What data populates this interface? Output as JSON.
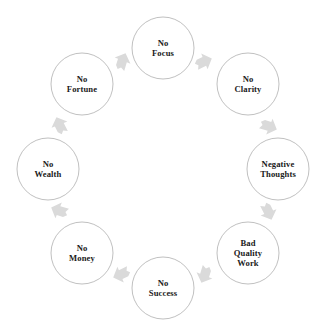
{
  "diagram": {
    "type": "cycle",
    "title": "",
    "background_color": "#ffffff",
    "circle_stroke_color": "#b9b9b9",
    "arrow_color": "#dadada",
    "text_color": "#1a1a1a",
    "direction": "clockwise",
    "node_count": 8,
    "nodes": [
      {
        "id": "no-focus",
        "label": "No Focus",
        "lines": [
          "No",
          "Focus"
        ],
        "cx": 163,
        "cy": 48,
        "r": 31
      },
      {
        "id": "no-clarity",
        "label": "No Clarity",
        "lines": [
          "No",
          "Clarity"
        ],
        "cx": 248,
        "cy": 84,
        "r": 31
      },
      {
        "id": "negative-thoughts",
        "label": "Negative Thoughts",
        "lines": [
          "Negative",
          "Thoughts"
        ],
        "cx": 278,
        "cy": 169,
        "r": 31
      },
      {
        "id": "bad-quality-work",
        "label": "Bad Quality Work",
        "lines": [
          "Bad",
          "Quality",
          "Work"
        ],
        "cx": 248,
        "cy": 253,
        "r": 31
      },
      {
        "id": "no-success",
        "label": "No Success",
        "lines": [
          "No",
          "Success"
        ],
        "cx": 163,
        "cy": 288,
        "r": 31
      },
      {
        "id": "no-money",
        "label": "No Money",
        "lines": [
          "No",
          "Money"
        ],
        "cx": 82,
        "cy": 253,
        "r": 31
      },
      {
        "id": "no-wealth",
        "label": "No Wealth",
        "lines": [
          "No",
          "Wealth"
        ],
        "cx": 48,
        "cy": 169,
        "r": 31
      },
      {
        "id": "no-fortune",
        "label": "No Fortune",
        "lines": [
          "No",
          "Fortune"
        ],
        "cx": 82,
        "cy": 84,
        "r": 31
      }
    ],
    "arrows": [
      {
        "id": "arrow-no-focus-to-no-clarity",
        "from": "no-focus",
        "to": "no-clarity",
        "cx": 203,
        "cy": 62,
        "angle": 68
      },
      {
        "id": "arrow-no-clarity-to-negative-thoughts",
        "from": "no-clarity",
        "to": "negative-thoughts",
        "cx": 268,
        "cy": 126,
        "angle": 112
      },
      {
        "id": "arrow-negative-thoughts-to-bad-quality-work",
        "from": "negative-thoughts",
        "to": "bad-quality-work",
        "cx": 268,
        "cy": 211,
        "angle": 158
      },
      {
        "id": "arrow-bad-quality-work-to-no-success",
        "from": "bad-quality-work",
        "to": "no-success",
        "cx": 205,
        "cy": 274,
        "angle": 202
      },
      {
        "id": "arrow-no-success-to-no-money",
        "from": "no-success",
        "to": "no-money",
        "cx": 122,
        "cy": 274,
        "angle": 248
      },
      {
        "id": "arrow-no-money-to-no-wealth",
        "from": "no-money",
        "to": "no-wealth",
        "cx": 60,
        "cy": 211,
        "angle": 292
      },
      {
        "id": "arrow-no-wealth-to-no-fortune",
        "from": "no-wealth",
        "to": "no-fortune",
        "cx": 60,
        "cy": 126,
        "angle": 338
      },
      {
        "id": "arrow-no-fortune-to-no-focus",
        "from": "no-fortune",
        "to": "no-focus",
        "cx": 122,
        "cy": 62,
        "angle": 22
      }
    ]
  }
}
